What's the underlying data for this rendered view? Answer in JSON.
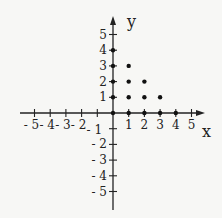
{
  "chart_data": {
    "type": "scatter",
    "title": "",
    "xlabel": "x",
    "ylabel": "y",
    "xlim": [
      -5,
      5
    ],
    "ylim": [
      -5,
      5
    ],
    "grid": false,
    "x_ticks": [
      -5,
      -4,
      -3,
      -2,
      -1,
      1,
      2,
      3,
      4,
      5
    ],
    "y_ticks": [
      -5,
      -4,
      -3,
      -2,
      -1,
      1,
      2,
      3,
      4,
      5
    ],
    "x_tick_labels": [
      "- 5",
      "- 4",
      "- 3",
      "- 2",
      "- 1",
      "1",
      "2",
      "3",
      "4",
      "5"
    ],
    "y_tick_labels": [
      "- 5",
      "- 4",
      "- 3",
      "- 2",
      "- 1",
      "1",
      "2",
      "3",
      "4",
      "5"
    ],
    "series": [
      {
        "name": "points",
        "x": [
          1,
          1,
          1,
          2,
          2,
          3
        ],
        "y": [
          1,
          2,
          3,
          1,
          2,
          1
        ]
      }
    ],
    "axis_dots": {
      "x": [
        0,
        1,
        2,
        3,
        4,
        0,
        0,
        0,
        0
      ],
      "y": [
        0,
        0,
        0,
        0,
        0,
        1,
        2,
        3,
        4
      ]
    }
  }
}
